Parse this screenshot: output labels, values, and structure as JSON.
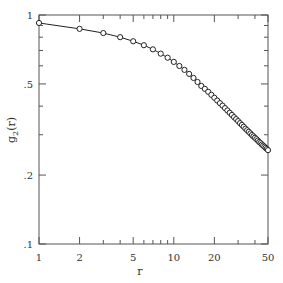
{
  "chart_data": {
    "type": "scatter",
    "title": "",
    "xlabel": "r",
    "ylabel": "g2(r)",
    "xscale": "log",
    "yscale": "log",
    "xlim": [
      1,
      50
    ],
    "ylim": [
      0.1,
      1
    ],
    "grid": false,
    "legend": null,
    "x_ticks": [
      1,
      2,
      5,
      10,
      20,
      50
    ],
    "x_tick_labels": [
      "1",
      "2",
      "5",
      "10",
      "20",
      "50"
    ],
    "y_ticks": [
      0.1,
      0.2,
      0.5,
      1
    ],
    "y_tick_labels": [
      ".1",
      ".2",
      ".5",
      "1"
    ],
    "series": [
      {
        "name": "data",
        "marker": "open-circle",
        "x": [
          1,
          2,
          3,
          4,
          5,
          6,
          7,
          8,
          9,
          10,
          11,
          12,
          13,
          14,
          15,
          16,
          17,
          18,
          19,
          20,
          21,
          22,
          23,
          24,
          25,
          26,
          27,
          28,
          29,
          30,
          31,
          32,
          33,
          34,
          35,
          36,
          37,
          38,
          39,
          40,
          41,
          42,
          43,
          44,
          45,
          46,
          47,
          48,
          49,
          50
        ],
        "y": [
          0.923,
          0.87,
          0.834,
          0.8,
          0.768,
          0.738,
          0.708,
          0.678,
          0.651,
          0.624,
          0.599,
          0.576,
          0.553,
          0.531,
          0.51,
          0.49,
          0.476,
          0.462,
          0.448,
          0.435,
          0.423,
          0.412,
          0.402,
          0.392,
          0.383,
          0.374,
          0.366,
          0.358,
          0.351,
          0.344,
          0.337,
          0.331,
          0.325,
          0.319,
          0.314,
          0.309,
          0.304,
          0.299,
          0.295,
          0.291,
          0.287,
          0.283,
          0.279,
          0.276,
          0.272,
          0.269,
          0.266,
          0.263,
          0.26,
          0.257
        ]
      },
      {
        "name": "fit",
        "style": "solid-line",
        "same_as": "data"
      }
    ]
  }
}
